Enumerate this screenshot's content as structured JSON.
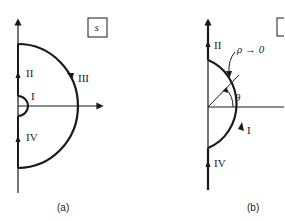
{
  "figure_a": {
    "caption": "(a)",
    "plane_label": "s",
    "segments": [
      {
        "id": "I",
        "label": "I",
        "description": "small semicircle around origin"
      },
      {
        "id": "II",
        "label": "II",
        "description": "positive imaginary axis"
      },
      {
        "id": "III",
        "label": "III",
        "description": "large semicircle arc"
      },
      {
        "id": "IV",
        "label": "IV",
        "description": "negative imaginary axis"
      }
    ]
  },
  "figure_b": {
    "caption": "(b)",
    "radius_label": "ρ → 0",
    "angle_label": "θ",
    "segments": [
      {
        "id": "I",
        "label": "I"
      },
      {
        "id": "II",
        "label": "II"
      },
      {
        "id": "IV",
        "label": "IV"
      }
    ]
  },
  "colors": {
    "stroke": "#1a1a1a",
    "background": "#ffffff"
  }
}
